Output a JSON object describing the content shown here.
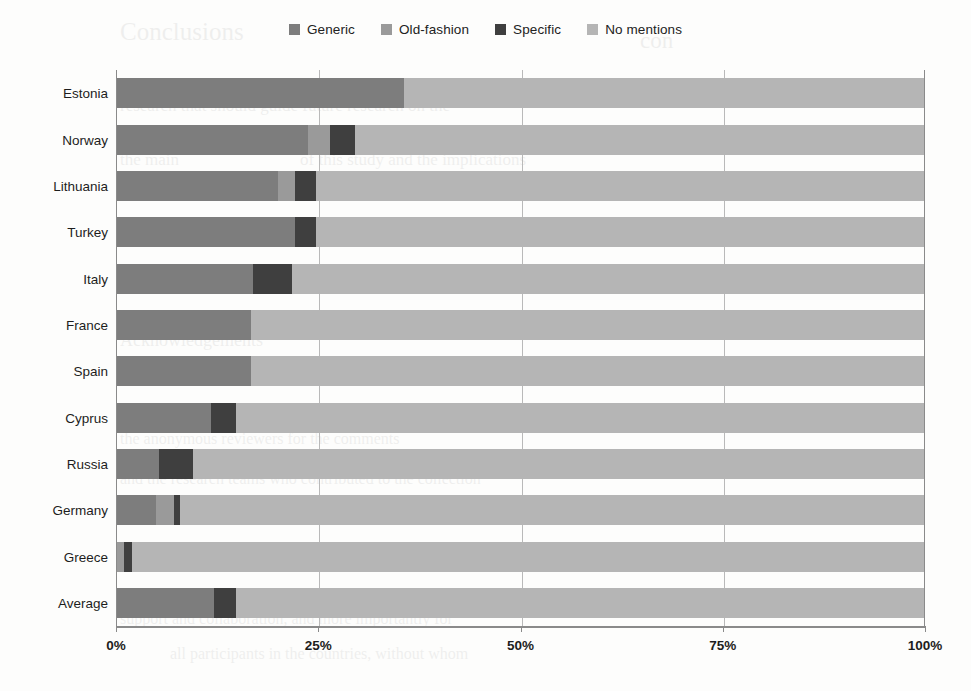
{
  "legend": {
    "position": "top-center",
    "items": [
      {
        "label": "Generic",
        "color": "#7d7d7d"
      },
      {
        "label": "Old-fashion",
        "color": "#9a9a9a"
      },
      {
        "label": "Specific",
        "color": "#3f3f3f"
      },
      {
        "label": "No mentions",
        "color": "#b5b5b5"
      }
    ]
  },
  "axis": {
    "x_ticks": [
      "0%",
      "25%",
      "50%",
      "75%",
      "100%"
    ],
    "x_tick_values": [
      0,
      25,
      50,
      75,
      100
    ]
  },
  "chart_data": {
    "type": "bar",
    "orientation": "horizontal",
    "stacked": true,
    "normalized": true,
    "title": "",
    "xlabel": "",
    "ylabel": "",
    "xlim": [
      0,
      100
    ],
    "grid": "vertical",
    "legend_position": "top-center",
    "categories": [
      "Estonia",
      "Norway",
      "Lithuania",
      "Turkey",
      "Italy",
      "France",
      "Spain",
      "Cyprus",
      "Russia",
      "Germany",
      "Greece",
      "Average"
    ],
    "series": [
      {
        "name": "Generic",
        "color": "#7d7d7d",
        "values": [
          35.6,
          23.7,
          20.0,
          22.1,
          16.9,
          16.6,
          16.6,
          11.6,
          5.2,
          4.8,
          0.0,
          12.0
        ]
      },
      {
        "name": "Old-fashion",
        "color": "#9a9a9a",
        "values": [
          0.0,
          2.7,
          2.1,
          0.0,
          0.0,
          0.0,
          0.0,
          0.0,
          0.0,
          2.3,
          0.9,
          0.0
        ]
      },
      {
        "name": "Specific",
        "color": "#3f3f3f",
        "values": [
          0.0,
          3.1,
          2.5,
          2.5,
          4.8,
          0.0,
          0.0,
          3.1,
          4.2,
          0.7,
          1.0,
          2.7
        ]
      },
      {
        "name": "No mentions",
        "color": "#b5b5b5",
        "values": [
          64.4,
          70.5,
          75.4,
          75.4,
          78.3,
          83.4,
          83.4,
          85.3,
          90.6,
          92.2,
          98.1,
          85.3
        ]
      }
    ]
  },
  "ghost": {
    "lines": [
      {
        "text": "Conclusions",
        "x": 120,
        "y": 18,
        "size": 25
      },
      {
        "text": "con",
        "x": 640,
        "y": 28,
        "size": 23
      },
      {
        "text": "research that should guide future research on the",
        "x": 120,
        "y": 96,
        "size": 17
      },
      {
        "text": "the main",
        "x": 120,
        "y": 150,
        "size": 17
      },
      {
        "text": "of this study and the implications",
        "x": 300,
        "y": 150,
        "size": 17
      },
      {
        "text": "Acknowledgements",
        "x": 120,
        "y": 330,
        "size": 18
      },
      {
        "text": "appendix the authors would like to thank",
        "x": 120,
        "y": 360,
        "size": 16
      },
      {
        "text": "the anonymous reviewers for the comments",
        "x": 120,
        "y": 430,
        "size": 16
      },
      {
        "text": "and the research teams who contributed to the collection",
        "x": 120,
        "y": 470,
        "size": 16
      },
      {
        "text": "professionals who read through this manuscript and",
        "x": 120,
        "y": 545,
        "size": 16
      },
      {
        "text": "provided invaluable feedback",
        "x": 540,
        "y": 545,
        "size": 16
      },
      {
        "text": "support and collaboration, and more importantly for",
        "x": 120,
        "y": 610,
        "size": 16
      },
      {
        "text": "all participants in the countries, without whom",
        "x": 170,
        "y": 645,
        "size": 16
      }
    ]
  }
}
